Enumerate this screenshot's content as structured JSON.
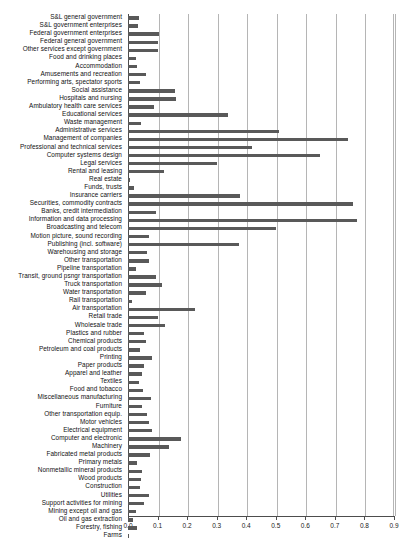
{
  "chart_data": {
    "type": "bar",
    "orientation": "horizontal",
    "title": "",
    "subtitle": "",
    "xlabel": "",
    "ylabel": "",
    "xlim": [
      0.0,
      0.9
    ],
    "grid": true,
    "legend": null,
    "xticks": [
      "0.0",
      "0.1",
      "0.2",
      "0.3",
      "0.4",
      "0.5",
      "0.6",
      "0.7",
      "0.8",
      "0.9"
    ],
    "xtick_values": [
      0.0,
      0.1,
      0.2,
      0.3,
      0.4,
      0.5,
      0.6,
      0.7,
      0.8,
      0.9
    ],
    "bar_color": "#595959",
    "axis_color": "#4d4d4d",
    "grid_color": "#b5b5b5",
    "categories": [
      "S&L general government",
      "S&L government enterprises",
      "Federal government enterprises",
      "Federal general government",
      "Other services except government",
      "Food and drinking places",
      "Accommodation",
      "Amusements and recreation",
      "Performing arts, spectator sports",
      "Social assistance",
      "Hospitals and nursing",
      "Ambulatory health care services",
      "Educational services",
      "Waste management",
      "Administrative services",
      "Management of companies",
      "Professional and technical services",
      "Computer systems design",
      "Legal services",
      "Rental and leasing",
      "Real estate",
      "Funds, trusts",
      "Insurance carriers",
      "Securities, commodity contracts",
      "Banks, credit intermediation",
      "Information and data processing",
      "Broadcasting and telecom",
      "Motion picture, sound recording",
      "Publishing (incl. software)",
      "Warehousing and storage",
      "Other transportation",
      "Pipeline transportation",
      "Transit, ground psngr transportation",
      "Truck transportation",
      "Water transportation",
      "Rail transportation",
      "Air transportation",
      "Retail trade",
      "Wholesale trade",
      "Plastics and rubber",
      "Chemical products",
      "Petroleum and coal products",
      "Printing",
      "Paper products",
      "Apparel and leather",
      "Textiles",
      "Food and tobacco",
      "Miscellaneous manufacturing",
      "Furniture",
      "Other transportation equip.",
      "Motor vehicles",
      "Electrical equipment",
      "Computer and electronic",
      "Machinery",
      "Fabricated metal products",
      "Primary metals",
      "Nonmetallic mineral products",
      "Wood products",
      "Construction",
      "Utilities",
      "Support activities for mining",
      "Mining except oil and gas",
      "Oil and gas extraction",
      "Forestry, fishing",
      "Farms"
    ],
    "values": [
      0.037,
      0.033,
      0.105,
      0.1,
      0.103,
      0.027,
      0.029,
      0.06,
      0.041,
      0.16,
      0.163,
      0.089,
      0.34,
      0.043,
      0.51,
      0.745,
      0.42,
      0.65,
      0.3,
      0.122,
      0.006,
      0.02,
      0.38,
      0.76,
      0.095,
      0.775,
      0.5,
      0.07,
      0.375,
      0.065,
      0.072,
      0.028,
      0.095,
      0.115,
      0.062,
      0.014,
      0.225,
      0.1,
      0.125,
      0.055,
      0.062,
      0.04,
      0.082,
      0.053,
      0.048,
      0.036,
      0.052,
      0.078,
      0.048,
      0.065,
      0.07,
      0.082,
      0.18,
      0.14,
      0.073,
      0.03,
      0.047,
      0.043,
      0.042,
      0.072,
      0.055,
      0.026,
      0.018,
      0.031,
      0.003
    ]
  }
}
